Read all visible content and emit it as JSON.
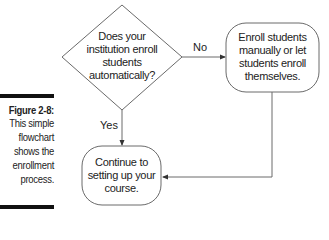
{
  "caption": {
    "title": "Figure 2-8:",
    "lines": [
      "This simple",
      "flowchart",
      "shows the",
      "enrollment",
      "process."
    ]
  },
  "flowchart": {
    "decision": {
      "lines": [
        "Does your",
        "institution enroll",
        "students",
        "automatically?"
      ]
    },
    "manual_box": {
      "lines": [
        "Enroll students",
        "manually or let",
        "students enroll",
        "themselves."
      ]
    },
    "continue_box": {
      "lines": [
        "Continue to",
        "setting up your",
        "course."
      ]
    },
    "edges": {
      "no_label": "No",
      "yes_label": "Yes"
    }
  },
  "colors": {
    "stroke": "#6a6a6a",
    "text": "#222222",
    "bar": "#111111"
  }
}
